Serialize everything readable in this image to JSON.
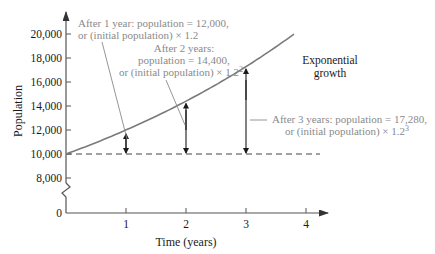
{
  "chart_data": {
    "type": "line",
    "title": "",
    "xlabel": "Time (years)",
    "ylabel": "Population",
    "x_ticks": [
      "1",
      "2",
      "3",
      "4"
    ],
    "y_ticks": [
      "0",
      "8,000",
      "10,000",
      "12,000",
      "14,000",
      "16,000",
      "18,000",
      "20,000"
    ],
    "xlim": [
      0,
      4
    ],
    "ylim_displayed": [
      8000,
      20000
    ],
    "axis_break": true,
    "grid": false,
    "series": [
      {
        "name": "Exponential growth",
        "x": [
          0,
          1,
          2,
          3,
          3.8
        ],
        "values": [
          10000,
          12000,
          14400,
          17280,
          19960
        ]
      },
      {
        "name": "Initial population (dashed)",
        "x": [
          0,
          4
        ],
        "values": [
          10000,
          10000
        ]
      }
    ],
    "annotations": [
      {
        "line1": "After 1 year: population = 12,000,",
        "line2": "or (initial population) × 1.2",
        "x": 1,
        "from": 10000,
        "to": 12000
      },
      {
        "line1": "After 2 years:",
        "line2": "population = 14,400,",
        "line3": "or (initial population) × 1.2",
        "sup": "2",
        "x": 2,
        "from": 10000,
        "to": 14400
      },
      {
        "line1": "After 3 years: population = 17,280,",
        "line2": "or (initial population) × 1.2",
        "sup": "3",
        "x": 3,
        "from": 10000,
        "to": 17280
      }
    ],
    "curve_label": [
      "Exponential",
      "growth"
    ],
    "colors": {
      "curve": "#7a7a7a",
      "axis": "#555555",
      "annotation_text": "#8a8a8a",
      "arrow": "#1a1a1a"
    }
  }
}
